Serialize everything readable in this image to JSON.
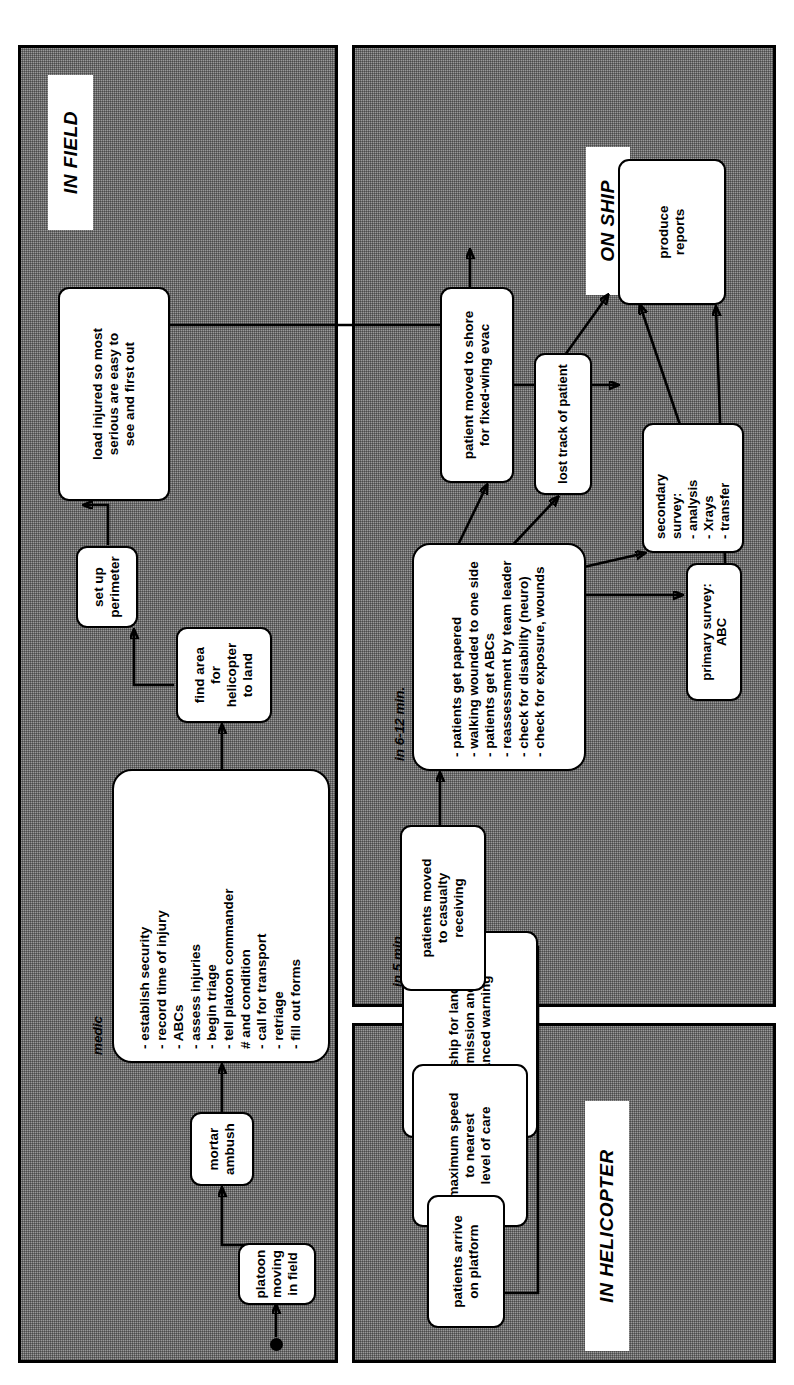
{
  "diagram": {
    "orientation": "rotated-90-ccw",
    "panels": [
      {
        "id": "in_field",
        "label": "IN FIELD"
      },
      {
        "id": "in_helicopter",
        "label": "IN HELICOPTER"
      },
      {
        "id": "on_ship",
        "label": "ON SHIP"
      }
    ],
    "captions": [
      {
        "id": "medic",
        "text": "medic"
      },
      {
        "id": "in_5_min",
        "text": "in 5 min."
      },
      {
        "id": "in_6_12_min",
        "text": "in 6-12 min."
      }
    ],
    "nodes": {
      "platoon_moving": "platoon\nmoving\nin field",
      "mortar_ambush": "mortar\nambush",
      "medic_tasks": "- establish security\n- record time of injury\n- ABCs\n- assess injuries\n- begin triage\n- tell platoon commander\n   # and condition\n- call for transport\n- retriage\n- fill out forms",
      "find_area": "find area\nfor helicopter\nto land",
      "set_up_perimeter": "set up\nperimeter",
      "load_injured": "load injured so most\nserious are easy to\nsee and first out",
      "radio_ship": "radio ship for landing\npermission and\nadvanced warning",
      "maximum_speed": "maximum speed\nto nearest\nlevel of care",
      "patients_arrive": "patients arrive\non platform",
      "patients_moved": "patients moved\nto casualty\nreceiving",
      "trauma_bay": "- patients get papered\n- walking wounded to one side\n- patients get ABCs\n- reassessment by team leader\n- check for disability (neuro)\n- check for exposure, wounds",
      "primary_survey": "primary survey: ABC",
      "secondary_survey": "secondary survey:\n- analysis\n- Xrays\n- transfer",
      "lost_track": "lost track of patient",
      "patient_to_shore": "patient moved to shore\nfor fixed-wing evac",
      "produce_reports": "produce\nreports"
    },
    "colors": {
      "panel_fill": "#9a9a9a",
      "node_fill": "#ffffff",
      "stroke": "#000000"
    }
  }
}
